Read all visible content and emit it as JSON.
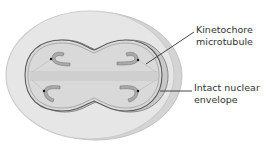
{
  "labels": {
    "kinetochore_line1": "Kinetochore",
    "kinetochore_line2": "microtubule",
    "envelope_line1": "Intact nuclear",
    "envelope_line2": "envelope"
  },
  "colors": {
    "cell_fill": "#e3e3e3",
    "cell_edge": "#c9c9c9",
    "nucleus_fill": "#d6d6d6",
    "nucleus_edge": "#6a6a6a",
    "chromosome": "#a8a8a8",
    "leader_line": "#333333"
  }
}
